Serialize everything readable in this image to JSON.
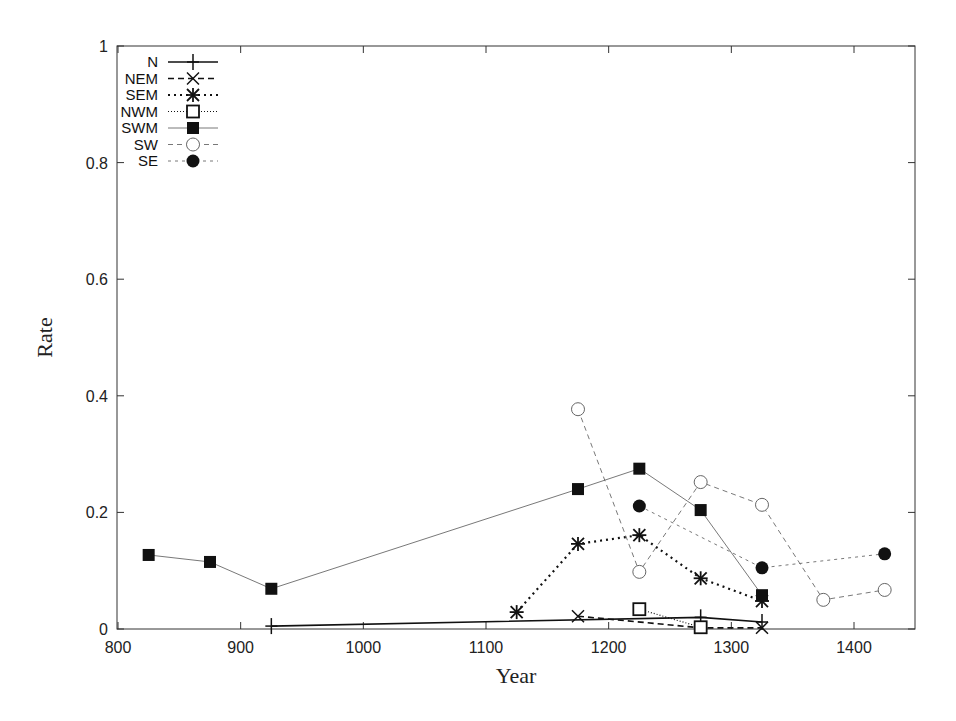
{
  "chart_data": {
    "type": "line",
    "title": "",
    "xlabel": "Year",
    "ylabel": "Rate",
    "xlim": [
      800,
      1450
    ],
    "ylim": [
      0,
      1
    ],
    "xticks": [
      800,
      900,
      1000,
      1100,
      1200,
      1300,
      1400
    ],
    "yticks": [
      0,
      0.2,
      0.4,
      0.6,
      0.8,
      1
    ],
    "ytick_labels": [
      "0",
      "0.2",
      "0.4",
      "0.6",
      "0.8",
      "1"
    ],
    "legend_position": "upper-left",
    "grid": false,
    "series": [
      {
        "name": "N",
        "marker": "plus",
        "dash": "",
        "width": 1.6,
        "points": [
          [
            925,
            0.005
          ],
          [
            1275,
            0.02
          ],
          [
            1325,
            0.012
          ]
        ]
      },
      {
        "name": "NEM",
        "marker": "x",
        "dash": "6,4",
        "width": 1.6,
        "points": [
          [
            1175,
            0.022
          ],
          [
            1275,
            0.002
          ],
          [
            1325,
            0.002
          ]
        ]
      },
      {
        "name": "SEM",
        "marker": "star",
        "dash": "2,4",
        "width": 2.2,
        "points": [
          [
            1125,
            0.029
          ],
          [
            1175,
            0.146
          ],
          [
            1225,
            0.161
          ],
          [
            1275,
            0.087
          ],
          [
            1325,
            0.048
          ]
        ]
      },
      {
        "name": "NWM",
        "marker": "open-square",
        "dash": "1,2",
        "width": 1.2,
        "points": [
          [
            1225,
            0.034
          ],
          [
            1275,
            0.003
          ]
        ]
      },
      {
        "name": "SWM",
        "marker": "filled-square",
        "dash": "",
        "width": 0.8,
        "points": [
          [
            825,
            0.127
          ],
          [
            875,
            0.115
          ],
          [
            925,
            0.069
          ],
          [
            1175,
            0.24
          ],
          [
            1225,
            0.275
          ],
          [
            1275,
            0.204
          ],
          [
            1325,
            0.058
          ]
        ]
      },
      {
        "name": "SW",
        "marker": "open-circle",
        "dash": "5,4",
        "width": 0.8,
        "points": [
          [
            1175,
            0.377
          ],
          [
            1225,
            0.098
          ],
          [
            1275,
            0.252
          ],
          [
            1325,
            0.213
          ],
          [
            1375,
            0.05
          ],
          [
            1425,
            0.067
          ]
        ]
      },
      {
        "name": "SE",
        "marker": "filled-circle",
        "dash": "3,4",
        "width": 0.8,
        "points": [
          [
            1225,
            0.211
          ],
          [
            1325,
            0.105
          ],
          [
            1425,
            0.129
          ]
        ]
      }
    ]
  }
}
